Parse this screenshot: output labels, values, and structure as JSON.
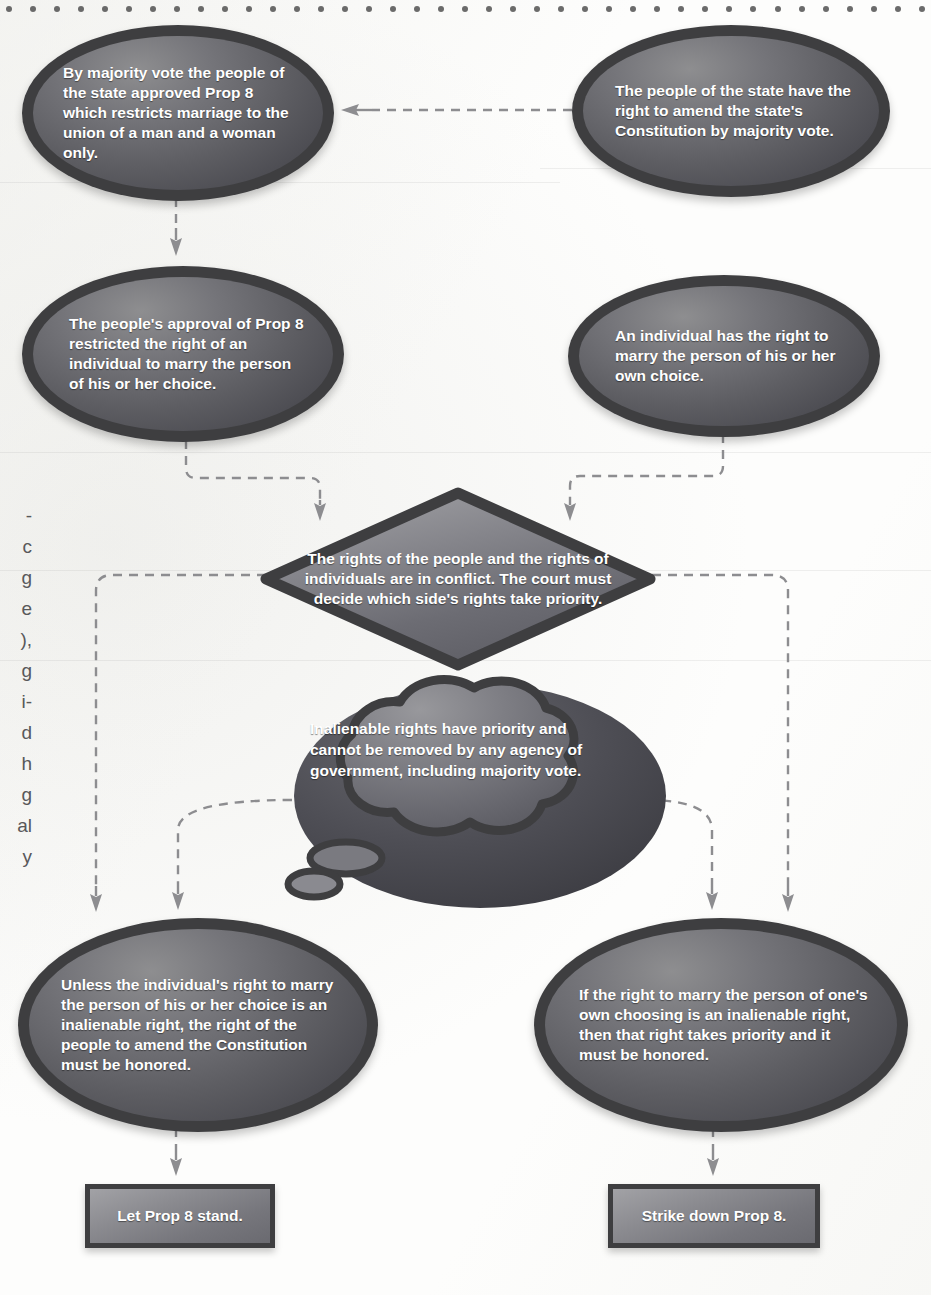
{
  "page": {
    "background_color": "#fdfdfc",
    "binding_dot_color": "#4b4b4b",
    "binding_dot_count": 39
  },
  "margin_bleed": {
    "name": "facing-page-bleed-through-text",
    "lines": [
      "-",
      "c",
      "g",
      "e",
      "),",
      "g",
      "i-",
      "d",
      "h",
      "g",
      "al",
      "y"
    ]
  },
  "diagram": {
    "type": "flowchart",
    "accent_dark": "#3e3e40",
    "accent_mid": "#6f6f75",
    "accent_light": "#9a9a9e",
    "connector_color": "#8d8d90",
    "nodes": [
      {
        "id": "n1",
        "shape": "ellipse",
        "name": "node-majority-vote-approved-prop8",
        "text": "By majority vote the people of the state approved Prop 8 which restricts marriage to the union of a man and a woman only."
      },
      {
        "id": "n2",
        "shape": "ellipse",
        "name": "node-people-right-to-amend",
        "text": "The people of the state have the right to amend the state's Constitution by majority vote."
      },
      {
        "id": "n3",
        "shape": "ellipse",
        "name": "node-approval-restricted-right",
        "text": "The people's approval of Prop 8 restricted the right of an individual to marry the person of his or her choice."
      },
      {
        "id": "n4",
        "shape": "ellipse",
        "name": "node-individual-right-to-marry",
        "text": "An individual has the right to marry the person of his or her own choice."
      },
      {
        "id": "n5",
        "shape": "diamond",
        "name": "node-rights-in-conflict-decision",
        "text": "The rights of the people and the rights of individuals are in conflict. The court must decide which side's rights take priority."
      },
      {
        "id": "n6",
        "shape": "cloud",
        "name": "node-inalienable-rights-priority",
        "text": "Inalienable rights have priority and cannot be removed by any agency of government, including majority vote."
      },
      {
        "id": "n7",
        "shape": "ellipse",
        "name": "node-unless-inalienable-honor-amendment",
        "text": "Unless the individual's right to marry the person of his or her choice is an inalienable right, the right of the people to amend the Constitution must be honored."
      },
      {
        "id": "n8",
        "shape": "ellipse",
        "name": "node-if-inalienable-right-takes-priority",
        "text": "If the right to marry the person of one's own choosing is an inalienable right, then that right takes priority and it must be honored."
      },
      {
        "id": "n9",
        "shape": "rectangle",
        "name": "node-outcome-let-prop8-stand",
        "text": "Let Prop 8 stand."
      },
      {
        "id": "n10",
        "shape": "rectangle",
        "name": "node-outcome-strike-down-prop8",
        "text": "Strike down Prop 8."
      }
    ],
    "edges": [
      {
        "from": "n2",
        "to": "n1",
        "style": "dashed",
        "direction": "left"
      },
      {
        "from": "n1",
        "to": "n3",
        "style": "dashed",
        "direction": "down"
      },
      {
        "from": "n3",
        "to": "n5",
        "style": "dashed",
        "direction": "down-right"
      },
      {
        "from": "n4",
        "to": "n5",
        "style": "dashed",
        "direction": "down-left"
      },
      {
        "from": "n5",
        "to": "n7",
        "style": "dashed",
        "direction": "left-down"
      },
      {
        "from": "n5",
        "to": "n8",
        "style": "dashed",
        "direction": "right-down"
      },
      {
        "from": "n6",
        "to": "n7",
        "style": "dashed",
        "direction": "left-down"
      },
      {
        "from": "n6",
        "to": "n8",
        "style": "dashed",
        "direction": "right-down"
      },
      {
        "from": "n7",
        "to": "n9",
        "style": "dashed",
        "direction": "down"
      },
      {
        "from": "n8",
        "to": "n10",
        "style": "dashed",
        "direction": "down"
      }
    ]
  }
}
